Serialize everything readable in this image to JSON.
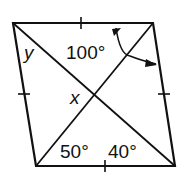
{
  "figure": {
    "type": "rhombus with diagonals",
    "labels": {
      "angle_top": "100°",
      "angle_bottom_left": "50°",
      "angle_bottom_right": "40°",
      "var_x": "x",
      "var_y": "y"
    },
    "colors": {
      "stroke": "#111111",
      "background": "#ffffff"
    }
  }
}
